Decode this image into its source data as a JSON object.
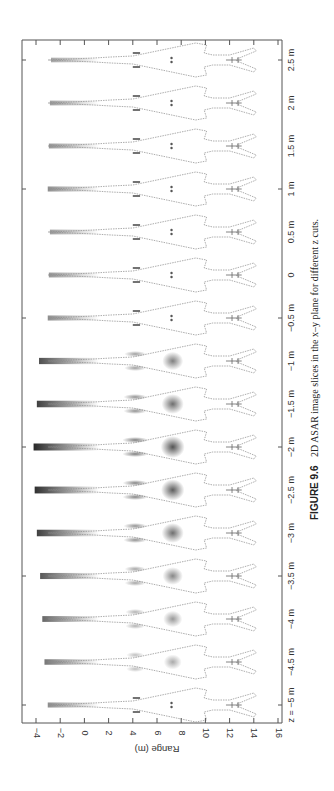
{
  "figure": {
    "caption_label": "FIGURE 9.6",
    "caption_text": "2D ASAR image slices in the x–y plane for different z cuts."
  },
  "chart_data": {
    "type": "heatmap",
    "title": "2D ASAR image slices in the x–y plane for different z cuts",
    "xlabel": "Range (m)",
    "ylabel": "z cut",
    "x_ticks": [
      -4,
      -2,
      0,
      2,
      4,
      6,
      8,
      10,
      12,
      14,
      16
    ],
    "x_tick_labels": [
      "−4",
      "−2",
      "0",
      "2",
      "4",
      "6",
      "8",
      "10",
      "12",
      "14",
      "16"
    ],
    "xlim": [
      -5.2,
      16
    ],
    "z_labels": [
      "z = −5 m",
      "−4.5 m",
      "−4 m",
      "−3.5 m",
      "−3 m",
      "−2.5 m",
      "−2 m",
      "−1.5 m",
      "−1 m",
      "−0.5 m",
      "0",
      "0.5 m",
      "1 m",
      "1.5 m",
      "2 m",
      "2.5 m"
    ],
    "z_values": [
      -5,
      -4.5,
      -4,
      -3.5,
      -3,
      -2.5,
      -2,
      -1.5,
      -1,
      -0.5,
      0,
      0.5,
      1,
      1.5,
      2,
      2.5
    ],
    "slice_relative_intensity": [
      0.35,
      0.5,
      0.6,
      0.7,
      0.85,
      0.95,
      1.0,
      0.85,
      0.75,
      0.35,
      0.3,
      0.25,
      0.35,
      0.3,
      0.25,
      0.2
    ],
    "orientation": "page rotated 90° counter-clockwise; range axis runs along bottom edge, z cuts stacked vertically",
    "grid": false,
    "colormap": "grayscale (dark = strong scattering)",
    "target": "aircraft outline (nose toward negative range, tail at ~10–14 m)"
  },
  "axes": {
    "range_label": "Range (m)",
    "range_ticks": [
      "−4",
      "−2",
      "0",
      "2",
      "4",
      "6",
      "8",
      "10",
      "12",
      "14",
      "16"
    ],
    "z_ticks": [
      "z = −5 m",
      "−4.5 m",
      "−4 m",
      "−3.5 m",
      "−3 m",
      "−2.5 m",
      "−2 m",
      "−1.5 m",
      "−1 m",
      "−0.5 m",
      "0",
      "0.5 m",
      "1 m",
      "1.5 m",
      "2 m",
      "2.5 m"
    ]
  },
  "colors": {
    "axis": "#555555",
    "outline": "#8a8a8a",
    "scatter": "#1a1a1a"
  }
}
